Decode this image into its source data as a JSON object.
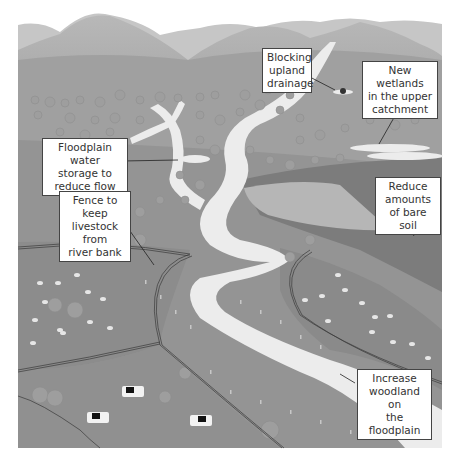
{
  "diagram": {
    "colors": {
      "mountain_far": "#c8c8c8",
      "mountain_near": "#a9a9a9",
      "land": "#8f8f8f",
      "field_dark": "#7e7e7e",
      "bare_soil": "#b2b2b2",
      "river": "#ececec",
      "tree": "#9a9a9a",
      "fence": "#3a3a3a",
      "label_border": "#444444"
    },
    "labels": [
      {
        "id": "blocking-upland-drainage",
        "text": "Blocking\nupland\ndrainage"
      },
      {
        "id": "new-wetlands",
        "text": "New wetlands\nin the upper\ncatchment"
      },
      {
        "id": "floodplain-water-storage",
        "text": "Floodplain water\nstorage to\nreduce flow"
      },
      {
        "id": "fence-livestock",
        "text": "Fence to keep\nlivestock from\nriver bank"
      },
      {
        "id": "reduce-bare-soil",
        "text": "Reduce\namounts\nof bare soil"
      },
      {
        "id": "increase-woodland",
        "text": "Increase\nwoodland on\nthe floodplain"
      }
    ]
  }
}
